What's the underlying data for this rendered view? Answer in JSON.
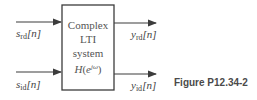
{
  "diagram": {
    "block": {
      "line1": "Complex",
      "line2": "LTI",
      "line3": "system",
      "transfer_fn": "H",
      "transfer_arg_base": "e",
      "transfer_arg_exp": "jω"
    },
    "inputs": [
      {
        "symbol": "s",
        "subscript": "rd",
        "index": "[n]"
      },
      {
        "symbol": "s",
        "subscript": "id",
        "index": "[n]"
      }
    ],
    "outputs": [
      {
        "symbol": "y",
        "subscript": "rd",
        "index": "[n]"
      },
      {
        "symbol": "y",
        "subscript": "id",
        "index": "[n]"
      }
    ],
    "caption": "Figure P12.34-2",
    "colors": {
      "line": "#3c3c3c",
      "text": "#444444"
    }
  }
}
